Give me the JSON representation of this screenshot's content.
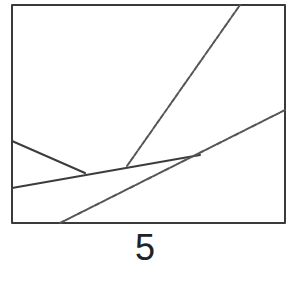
{
  "figure": {
    "label": "5",
    "frame": {
      "x1": 12,
      "y1": 5,
      "x2": 285,
      "y2": 223
    },
    "lines": [
      {
        "name": "line-a",
        "x1": 12,
        "y1": 141,
        "x2": 85,
        "y2": 173,
        "style": "solid"
      },
      {
        "name": "line-b",
        "x1": 12,
        "y1": 188,
        "x2": 200,
        "y2": 155,
        "style": "solid"
      },
      {
        "name": "line-c",
        "x1": 127,
        "y1": 166,
        "x2": 240,
        "y2": 5,
        "style": "dashed"
      },
      {
        "name": "line-d",
        "x1": 60,
        "y1": 223,
        "x2": 285,
        "y2": 110,
        "style": "dashed"
      }
    ],
    "stroke_color": "#3c3c3c"
  }
}
